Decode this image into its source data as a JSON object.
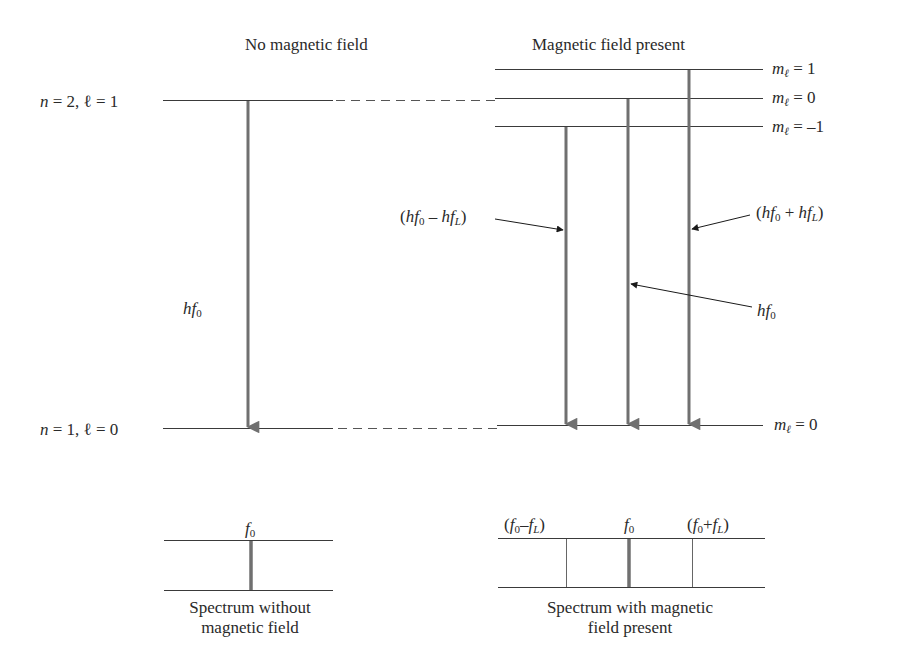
{
  "headings": {
    "left": "No magnetic field",
    "right": "Magnetic field present"
  },
  "levels": {
    "upper_left": {
      "n": "n",
      "eq1": "=",
      "n_val": "2,",
      "l": "ℓ",
      "eq2": "=",
      "l_val": "1"
    },
    "lower_left": {
      "n": "n",
      "eq1": "=",
      "n_val": "1,",
      "l": "ℓ",
      "eq2": "=",
      "l_val": "0"
    },
    "right_upper": [
      {
        "m": "m",
        "sub": "ℓ",
        "eq": "=",
        "val": "1"
      },
      {
        "m": "m",
        "sub": "ℓ",
        "eq": "=",
        "val": "0"
      },
      {
        "m": "m",
        "sub": "ℓ",
        "eq": "=",
        "val": "–1"
      }
    ],
    "right_lower": {
      "m": "m",
      "sub": "ℓ",
      "eq": "=",
      "val": "0"
    }
  },
  "transitions": {
    "left_label": {
      "h": "hf",
      "sub": "0"
    },
    "minus_label": {
      "open": "(",
      "h1": "hf",
      "sub1": "0",
      "op": "–",
      "h2": "hf",
      "sub2": "L",
      "close": ")"
    },
    "center_label": {
      "h": "hf",
      "sub": "0"
    },
    "plus_label": {
      "open": "(",
      "h1": "hf",
      "sub1": "0",
      "op": "+",
      "h2": "hf",
      "sub2": "L",
      "close": ")"
    }
  },
  "spectra": {
    "left": {
      "line_label": {
        "f": "f",
        "sub": "0"
      },
      "caption_line1": "Spectrum without",
      "caption_line2": "magnetic field"
    },
    "right": {
      "minus_label": {
        "open": "(",
        "f1": "f",
        "sub1": "0",
        "op": "–",
        "f2": "f",
        "sub2": "L",
        "close": ")"
      },
      "center_label": {
        "f": "f",
        "sub": "0"
      },
      "plus_label": {
        "open": "(",
        "f1": "f",
        "sub1": "0",
        "op": "+",
        "f2": "f",
        "sub2": "L",
        "close": ")"
      },
      "caption_line1": "Spectrum with magnetic",
      "caption_line2": "field present"
    }
  },
  "colors": {
    "level_line": "#3a3a3a",
    "arrow": "#707070",
    "text": "#2a2a2a"
  }
}
